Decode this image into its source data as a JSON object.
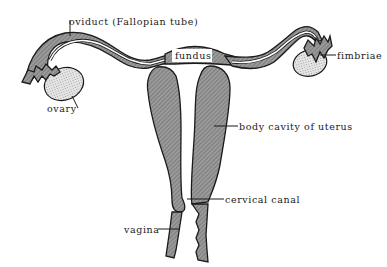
{
  "diagram": {
    "colors": {
      "tissue": "#8a8a8a",
      "ovary": "#d8d8d8",
      "outline": "#1a1a1a",
      "background": "#ffffff"
    },
    "labels": {
      "oviduct": "oviduct (Fallopian tube)",
      "fundus": "fundus",
      "fimbriae": "fimbriae",
      "ovary": "ovary",
      "body_cavity": "body cavity of uterus",
      "cervical_canal": "cervical canal",
      "vagina": "vagina"
    }
  }
}
